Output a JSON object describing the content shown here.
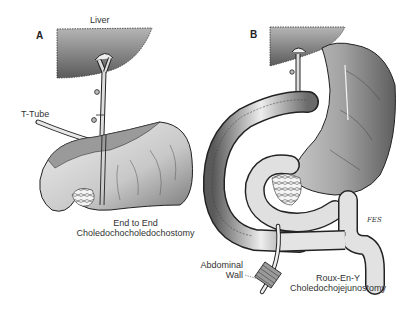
{
  "figure": {
    "panels": [
      {
        "letter": "A",
        "labels": {
          "liver": "Liver",
          "t_tube": "T-Tube",
          "caption_line1": "End to End",
          "caption_line2": "Choledochocholedochostomy"
        }
      },
      {
        "letter": "B",
        "labels": {
          "abdominal_line1": "Abdominal",
          "abdominal_line2": "Wall",
          "caption_line1": "Roux-En-Y",
          "caption_line2": "Choledochojejunostomy",
          "signature": "FES"
        }
      }
    ],
    "colors": {
      "ink": "#1e1e1e",
      "liver_fill": "#8a8a8a",
      "organ_fill": "#d6d6d6",
      "organ_shade": "#a9a9a9",
      "stomach_fill": "#9e9e9e",
      "background": "#ffffff"
    }
  }
}
